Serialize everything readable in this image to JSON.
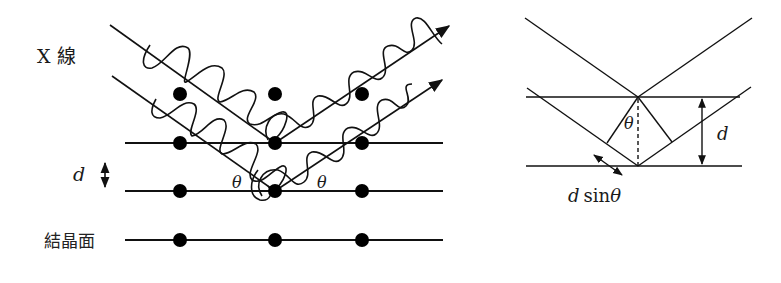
{
  "left_diagram": {
    "title": "Bragg reflection from crystal planes",
    "xray_label": "X 線",
    "spacing_label": "d",
    "plane_label": "結晶面",
    "angle_label_left": "θ",
    "angle_label_right": "θ",
    "atom_rows": [
      {
        "y": 94,
        "xs": [
          180,
          275,
          362
        ]
      },
      {
        "y": 143,
        "xs": [
          180,
          275,
          362
        ]
      },
      {
        "y": 191,
        "xs": [
          180,
          275,
          362
        ]
      },
      {
        "y": 240,
        "xs": [
          180,
          275,
          362
        ]
      }
    ],
    "planes_y": [
      143,
      191,
      240
    ]
  },
  "right_diagram": {
    "title": "Path difference geometry",
    "angle_label": "θ",
    "spacing_label": "d",
    "path_diff_label_d": "d",
    "path_diff_label_sin": "sin",
    "path_diff_label_theta": "θ"
  },
  "colors": {
    "stroke": "#111111",
    "background": "#ffffff"
  }
}
